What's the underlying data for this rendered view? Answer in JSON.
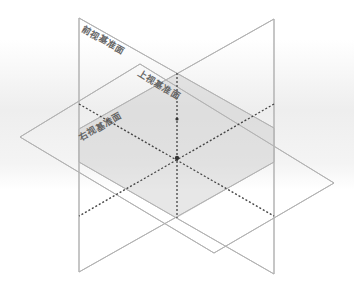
{
  "diagram": {
    "title": "",
    "type": "reference-planes-isometric",
    "planes": [
      {
        "id": "front",
        "label": "前视基准面",
        "meaning": "Front Plane"
      },
      {
        "id": "top",
        "label": "上视基准面",
        "meaning": "Top Plane"
      },
      {
        "id": "right",
        "label": "右视基准面",
        "meaning": "Right Plane"
      }
    ],
    "origin_marker": "origin-point",
    "colors": {
      "edge": "#b3b3b3",
      "axis": "#444444",
      "fill_dark": "#c8c8c8",
      "fill_light": "#f4f4f4",
      "label": "#666666"
    }
  }
}
